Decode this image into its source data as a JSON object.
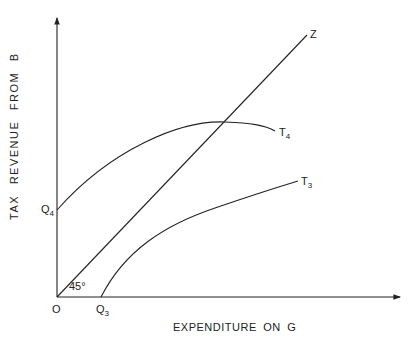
{
  "diagram": {
    "y_axis_label": "TAX REVENUE FROM B",
    "x_axis_label": "EXPENDITURE ON G",
    "origin_label": "O",
    "angle_label": "45°",
    "points": {
      "q4": {
        "main": "Q",
        "sub": "4"
      },
      "q3": {
        "main": "Q",
        "sub": "3"
      }
    },
    "curves": {
      "z": {
        "label": "Z"
      },
      "t4": {
        "main": "T",
        "sub": "4"
      },
      "t3": {
        "main": "T",
        "sub": "3"
      }
    },
    "colors": {
      "line": "#222222",
      "background": "#ffffff"
    }
  }
}
